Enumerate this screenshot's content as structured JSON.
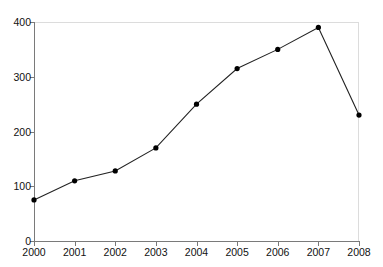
{
  "caption": {
    "text": "",
    "note": "caption row cropped off at top of screenshot"
  },
  "chart_data": {
    "type": "line",
    "title": "",
    "subtitle": "",
    "xlabel": "",
    "ylabel": "",
    "categories": [
      "2000",
      "2001",
      "2002",
      "2003",
      "2004",
      "2005",
      "2006",
      "2007",
      "2008"
    ],
    "x": [
      2000,
      2001,
      2002,
      2003,
      2004,
      2005,
      2006,
      2007,
      2008
    ],
    "values": [
      75,
      110,
      128,
      170,
      250,
      315,
      350,
      390,
      230
    ],
    "series": [
      {
        "name": "",
        "values": [
          75,
          110,
          128,
          170,
          250,
          315,
          350,
          390,
          230
        ]
      }
    ],
    "xlim": [
      2000,
      2008
    ],
    "ylim": [
      0,
      400
    ],
    "yticks": [
      0,
      100,
      200,
      300,
      400
    ],
    "ytick_labels": [
      "0",
      "100",
      "200",
      "300",
      "400"
    ],
    "xticks": [
      2000,
      2001,
      2002,
      2003,
      2004,
      2005,
      2006,
      2007,
      2008
    ],
    "xtick_labels": [
      "2000",
      "2001",
      "2002",
      "2003",
      "2004",
      "2005",
      "2006",
      "2007",
      "2008"
    ],
    "grid": false,
    "legend": null,
    "legend_position": "none",
    "annotations": [],
    "marker": "circle",
    "line_color": "#222222",
    "marker_color": "#000000",
    "axis_color": "#7a7a7a",
    "frame_color": "#dcdcdc",
    "background": "#ffffff"
  }
}
